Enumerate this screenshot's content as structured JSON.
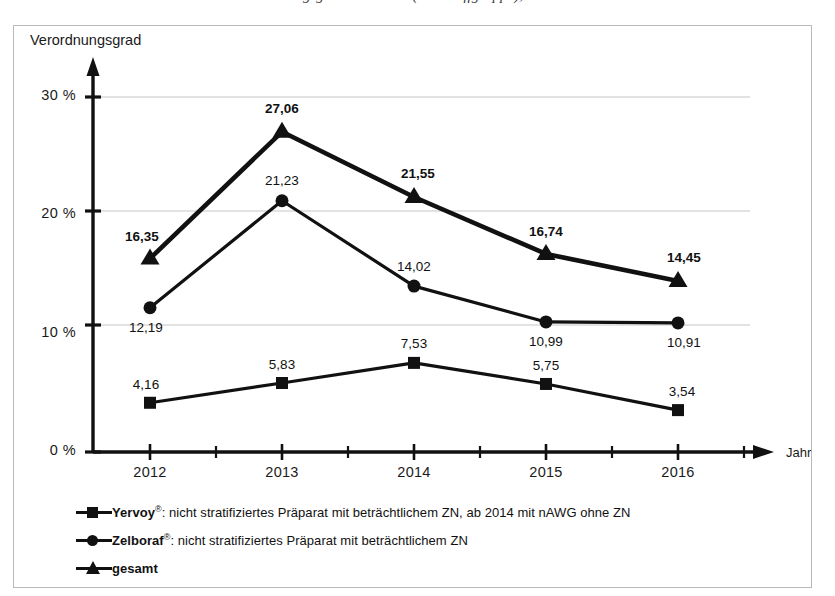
{
  "figure": {
    "title_cropped": "Verordnungsgrad nach Jahr (Wirkstoffgruppe), 2012–2016",
    "frame_border_color": "#b9b9b9",
    "background_color": "#ffffff",
    "ink_color": "#111111",
    "gridline_color": "#c6c6c6"
  },
  "chart_data": {
    "type": "line",
    "title": "",
    "xlabel": "Jahr",
    "ylabel": "Verordnungsgrad",
    "categories": [
      "2012",
      "2013",
      "2014",
      "2015",
      "2016"
    ],
    "ytick_labels": [
      "0 %",
      "10 %",
      "20 %",
      "30 %"
    ],
    "ytick_values": [
      0,
      10,
      20,
      30
    ],
    "ylim": [
      0,
      32
    ],
    "grid": true,
    "legend_position": "below-axis-left",
    "series": [
      {
        "name": "Yervoy®: nicht stratifiziertes Präparat mit beträchtlichem ZN, ab 2014 mit nAWG ohne ZN",
        "short_name": "Yervoy",
        "marker": "square",
        "bold_labels": false,
        "values": [
          4.16,
          5.83,
          7.53,
          5.75,
          3.54
        ],
        "labels": [
          "4,16",
          "5,83",
          "7,53",
          "5,75",
          "3,54"
        ]
      },
      {
        "name": "Zelboraf®: nicht stratifiziertes Präparat mit beträchtlichem ZN",
        "short_name": "Zelboraf",
        "marker": "circle",
        "bold_labels": false,
        "values": [
          12.19,
          21.23,
          14.02,
          10.99,
          10.91
        ],
        "labels": [
          "12,19",
          "21,23",
          "14,02",
          "10,99",
          "10,91"
        ]
      },
      {
        "name": "gesamt",
        "short_name": "gesamt",
        "marker": "triangle",
        "bold_labels": true,
        "values": [
          16.35,
          27.06,
          21.55,
          16.74,
          14.45
        ],
        "labels": [
          "16,35",
          "27,06",
          "21,55",
          "16,74",
          "14,45"
        ]
      }
    ]
  },
  "axes": {
    "y_title": "Verordnungsgrad",
    "x_title": "Jahr"
  },
  "legend": {
    "rows": [
      {
        "marker": "square",
        "text_before": "Yervoy",
        "registered": "®",
        "text_after": ": nicht stratifiziertes Präparat mit beträchtlichem ZN, ab 2014 mit nAWG ohne ZN"
      },
      {
        "marker": "circle",
        "text_before": "Zelboraf",
        "registered": "®",
        "text_after": ": nicht stratifiziertes Präparat mit beträchtlichem ZN"
      },
      {
        "marker": "triangle",
        "text_before": "gesamt",
        "registered": "",
        "text_after": ""
      }
    ]
  }
}
